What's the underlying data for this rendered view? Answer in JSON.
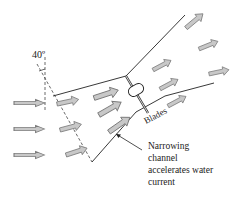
{
  "diagram": {
    "angle_label": "40º",
    "blades_label": "Blades",
    "annotation": {
      "lines": [
        "Narrowing",
        "channel",
        "accelerates water",
        "current"
      ]
    },
    "colors": {
      "arrow_fill": "#c8c8c8",
      "arrow_stroke": "#7a7a7a",
      "line": "#222222"
    }
  }
}
